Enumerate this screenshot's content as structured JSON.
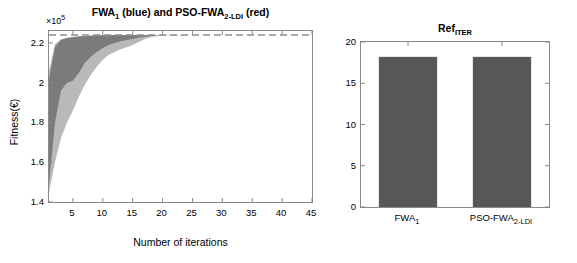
{
  "figure": {
    "background": "#ffffff",
    "panels": [
      "convergence",
      "ref_iter"
    ]
  },
  "chart_data": [
    {
      "id": "convergence",
      "type": "area",
      "title": "FWA1 (blue) and PSO-FWA2-LDI (red)",
      "title_parts": {
        "a": "FWA",
        "a_sub": "1",
        "mid": " (blue) and PSO-FWA",
        "b_sub": "2-LDI",
        "tail": " (red)"
      },
      "xlabel": "Number of iterations",
      "ylabel": "Fitness(€)",
      "y_exponent": "×10",
      "y_exponent_power": "5",
      "y_multiplier": 100000,
      "xlim": [
        1,
        45
      ],
      "ylim": [
        1.4,
        2.26
      ],
      "xticks": [
        5,
        10,
        15,
        20,
        25,
        30,
        35,
        40,
        45
      ],
      "yticks": [
        1.4,
        1.6,
        1.8,
        2,
        2.2
      ],
      "ytick_labels": [
        "1.4",
        "1.6",
        "1.8",
        "2",
        "2.2"
      ],
      "grid": false,
      "legend": "in-title",
      "reference_line": {
        "y": 2.24,
        "style": "dashed",
        "color": "#8f8f8f"
      },
      "series": [
        {
          "name": "FWA1 band (dark gray)",
          "color": "#6e6e6e",
          "kind": "band",
          "x": [
            1,
            2,
            3,
            4,
            5,
            6,
            7,
            8,
            9,
            10,
            11,
            12,
            13,
            14,
            15,
            16,
            17,
            18,
            19,
            20,
            25,
            30,
            35,
            40,
            45
          ],
          "upper": [
            2.02,
            2.18,
            2.215,
            2.225,
            2.228,
            2.232,
            2.234,
            2.236,
            2.237,
            2.238,
            2.239,
            2.2395,
            2.24,
            2.24,
            2.24,
            2.24,
            2.24,
            2.24,
            2.24,
            2.24,
            2.24,
            2.24,
            2.24,
            2.24,
            2.24
          ],
          "lower": [
            1.49,
            1.8,
            1.96,
            2.0,
            2.01,
            2.05,
            2.1,
            2.13,
            2.155,
            2.175,
            2.19,
            2.2,
            2.208,
            2.215,
            2.22,
            2.226,
            2.231,
            2.235,
            2.238,
            2.239,
            2.24,
            2.24,
            2.24,
            2.24,
            2.24
          ]
        },
        {
          "name": "PSO-FWA2-LDI band (light gray)",
          "color": "#b9b9b9",
          "kind": "band",
          "x": [
            1,
            2,
            3,
            4,
            5,
            6,
            7,
            8,
            9,
            10,
            11,
            12,
            13,
            14,
            15,
            16,
            17,
            18,
            19,
            20,
            25,
            30,
            35,
            40,
            45
          ],
          "upper": [
            2.06,
            2.195,
            2.218,
            2.226,
            2.23,
            2.233,
            2.235,
            2.237,
            2.238,
            2.239,
            2.2395,
            2.24,
            2.24,
            2.24,
            2.24,
            2.24,
            2.24,
            2.24,
            2.24,
            2.24,
            2.24,
            2.24,
            2.24,
            2.24,
            2.24
          ],
          "lower": [
            1.45,
            1.6,
            1.72,
            1.8,
            1.86,
            1.93,
            1.99,
            2.04,
            2.08,
            2.115,
            2.14,
            2.155,
            2.168,
            2.178,
            2.19,
            2.205,
            2.218,
            2.228,
            2.234,
            2.238,
            2.24,
            2.24,
            2.24,
            2.24,
            2.24
          ]
        }
      ]
    },
    {
      "id": "ref_iter",
      "type": "bar",
      "title": "RefITER",
      "title_parts": {
        "base": "Ref",
        "sub": "ITER"
      },
      "xlabel": "",
      "ylabel": "",
      "ylim": [
        0,
        20
      ],
      "yticks": [
        0,
        5,
        10,
        15,
        20
      ],
      "ytick_labels": [
        "0",
        "5",
        "10",
        "15",
        "20"
      ],
      "grid": false,
      "bar_color": "#575757",
      "categories": [
        "FWA1",
        "PSO-FWA2-LDI"
      ],
      "category_parts": [
        {
          "base": "FWA",
          "sub": "1"
        },
        {
          "base": "PSO-FWA",
          "sub": "2-LDI"
        }
      ],
      "values": [
        18.2,
        18.2
      ]
    }
  ],
  "convergence": {
    "title_a": "FWA",
    "title_a_sub": "1",
    "title_mid": " (blue) and PSO-FWA",
    "title_b_sub": "2-LDI",
    "title_tail": " (red)",
    "exponent_text": "×10",
    "exponent_power": "5",
    "ylabel": "Fitness(€)",
    "xlabel": "Number of iterations",
    "yticks": [
      "1.4",
      "1.6",
      "1.8",
      "2",
      "2.2"
    ],
    "xticks": [
      "5",
      "10",
      "15",
      "20",
      "25",
      "30",
      "35",
      "40",
      "45"
    ]
  },
  "ref_iter": {
    "title_base": "Ref",
    "title_sub": "ITER",
    "yticks": [
      "0",
      "5",
      "10",
      "15",
      "20"
    ],
    "cat1_base": "FWA",
    "cat1_sub": "1",
    "cat2_base": "PSO-FWA",
    "cat2_sub": "2-LDI"
  }
}
